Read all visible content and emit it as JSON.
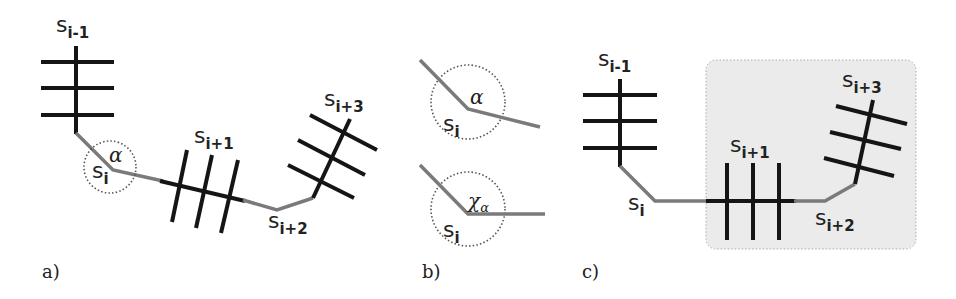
{
  "figure": {
    "panels": [
      {
        "id": "a",
        "label": "a)",
        "nodes": [
          {
            "base": "s",
            "sub": "i-1"
          },
          {
            "base": "s",
            "sub": "i"
          },
          {
            "base": "s",
            "sub": "i+1"
          },
          {
            "base": "s",
            "sub": "i+2"
          },
          {
            "base": "s",
            "sub": "i+3"
          }
        ],
        "angle_label": "α"
      },
      {
        "id": "b",
        "label": "b)",
        "top": {
          "node": {
            "base": "s",
            "sub": "i"
          },
          "angle_label": "α"
        },
        "bottom": {
          "node": {
            "base": "s",
            "sub": "i"
          },
          "angle_label": "χ",
          "angle_sub": "α"
        }
      },
      {
        "id": "c",
        "label": "c)",
        "nodes": [
          {
            "base": "s",
            "sub": "i-1"
          },
          {
            "base": "s",
            "sub": "i"
          },
          {
            "base": "s",
            "sub": "i+1"
          },
          {
            "base": "s",
            "sub": "i+2"
          },
          {
            "base": "s",
            "sub": "i+3"
          }
        ]
      }
    ],
    "colors": {
      "segment_black": "#151515",
      "connector_gray": "#7a7a7a",
      "highlight_box": "#ebebeb"
    }
  }
}
